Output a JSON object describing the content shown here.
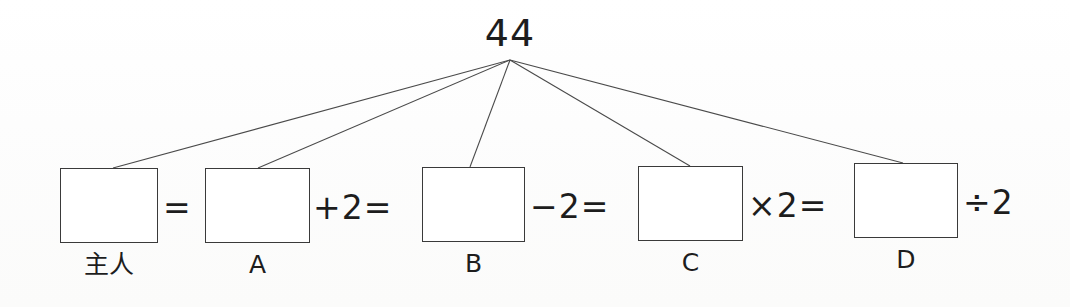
{
  "figure": {
    "title_value": "44",
    "boxes": [
      {
        "id": "owner",
        "label": "主人",
        "value": "",
        "x": 60,
        "y": 168,
        "w": 98,
        "h": 75,
        "connector_x": 113
      },
      {
        "id": "a",
        "label": "A",
        "value": "",
        "x": 205,
        "y": 168,
        "w": 105,
        "h": 75,
        "connector_x": 258
      },
      {
        "id": "b",
        "label": "B",
        "value": "",
        "x": 422,
        "y": 167,
        "w": 103,
        "h": 75,
        "connector_x": 470
      },
      {
        "id": "c",
        "label": "C",
        "value": "",
        "x": 638,
        "y": 166,
        "w": 105,
        "h": 75,
        "connector_x": 690
      },
      {
        "id": "d",
        "label": "D",
        "value": "",
        "x": 854,
        "y": 163,
        "w": 104,
        "h": 75,
        "connector_x": 903
      }
    ],
    "operators": [
      {
        "id": "eq-1",
        "text": "=",
        "x": 163,
        "y": 190
      },
      {
        "id": "plus-2-eq",
        "text": "+2=",
        "x": 313,
        "y": 190
      },
      {
        "id": "minus-2-eq",
        "text": "−2=",
        "x": 530,
        "y": 189
      },
      {
        "id": "times-2-eq",
        "text": "×2=",
        "x": 748,
        "y": 188
      },
      {
        "id": "divide-2",
        "text": "÷2",
        "x": 963,
        "y": 185
      }
    ],
    "apex": {
      "x": 510,
      "y": 60
    },
    "stroke_color": "#3a3a3a",
    "text_color": "#1d1d1d",
    "background_color": "#fdfdfc"
  }
}
